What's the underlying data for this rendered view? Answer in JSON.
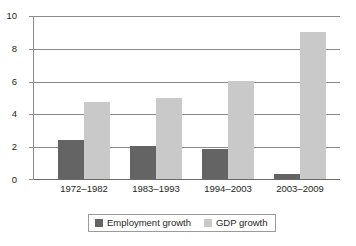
{
  "chart_data": {
    "type": "bar",
    "title": "",
    "subtitle": "",
    "xlabel": "",
    "ylabel": "",
    "categories": [
      "1972–1982",
      "1983–1993",
      "1994–2003",
      "2003–2009"
    ],
    "series": [
      {
        "name": "Employment growth",
        "color": "#646464",
        "values": [
          2.4,
          2.0,
          1.85,
          0.3
        ]
      },
      {
        "name": "GDP growth",
        "color": "#c9c9c9",
        "values": [
          4.7,
          5.0,
          6.0,
          9.05
        ]
      }
    ],
    "ylim": [
      0,
      10
    ],
    "yticks": [
      0,
      2,
      4,
      6,
      8,
      10
    ],
    "ytick_labels": [
      "0",
      "2",
      "4",
      "6",
      "8",
      "10"
    ],
    "grid": true,
    "grid_axis": "y",
    "legend_position": "bottom-center",
    "bar_grouping": "grouped",
    "annotations": []
  },
  "axis": {
    "y_tick_0": "0",
    "y_tick_1": "2",
    "y_tick_2": "4",
    "y_tick_3": "6",
    "y_tick_4": "8",
    "y_tick_5": "10"
  },
  "categories_text": {
    "c0": "1972–1982",
    "c1": "1983–1993",
    "c2": "1994–2003",
    "c3": "2003–2009"
  },
  "legend": {
    "entries": [
      {
        "label": "Employment growth",
        "color": "#646464"
      },
      {
        "label": "GDP growth",
        "color": "#c9c9c9"
      }
    ]
  }
}
